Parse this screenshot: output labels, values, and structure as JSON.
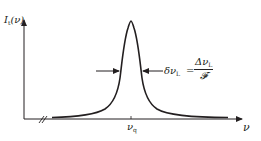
{
  "diagram": {
    "type": "lorentzian-resonance-lineshape",
    "y_axis": {
      "label_main": "I",
      "label_sub": "t",
      "label_arg": "(ν)"
    },
    "x_axis": {
      "label": "ν",
      "tick_label_main": "ν",
      "tick_label_sub": "q",
      "axis_break": "//"
    },
    "annotation": {
      "lhs_main": "δν",
      "lhs_sub": "L",
      "equals": "=",
      "numerator_main": "Δν",
      "numerator_sub": "L",
      "denominator": "𝓕"
    },
    "colors": {
      "ink": "#231f20",
      "background": "#ffffff"
    }
  }
}
